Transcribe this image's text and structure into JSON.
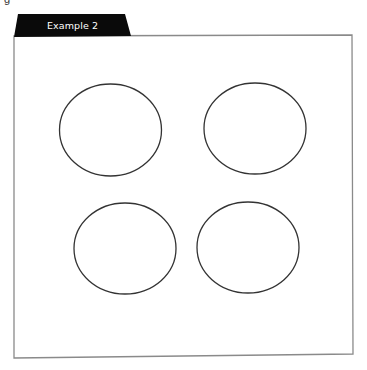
{
  "caption_fragment": "g",
  "frame": {
    "tab_label": "Example 2",
    "tab_color": "#0a0a0a",
    "tab_text_color": "#ffffff",
    "border_color": "#8a8a8a",
    "background": "#ffffff"
  },
  "shapes": {
    "stroke_color": "#333333",
    "stroke_width": 1.3,
    "ellipses": [
      {
        "name": "ellipse-top-left",
        "cx": 110.5,
        "cy": 130,
        "rx": 51,
        "ry": 46
      },
      {
        "name": "ellipse-top-right",
        "cx": 255,
        "cy": 128.5,
        "rx": 51,
        "ry": 45.5
      },
      {
        "name": "ellipse-bottom-left",
        "cx": 125,
        "cy": 248.5,
        "rx": 51,
        "ry": 45.5
      },
      {
        "name": "ellipse-bottom-right",
        "cx": 248,
        "cy": 247.5,
        "rx": 51,
        "ry": 45.5
      }
    ]
  }
}
